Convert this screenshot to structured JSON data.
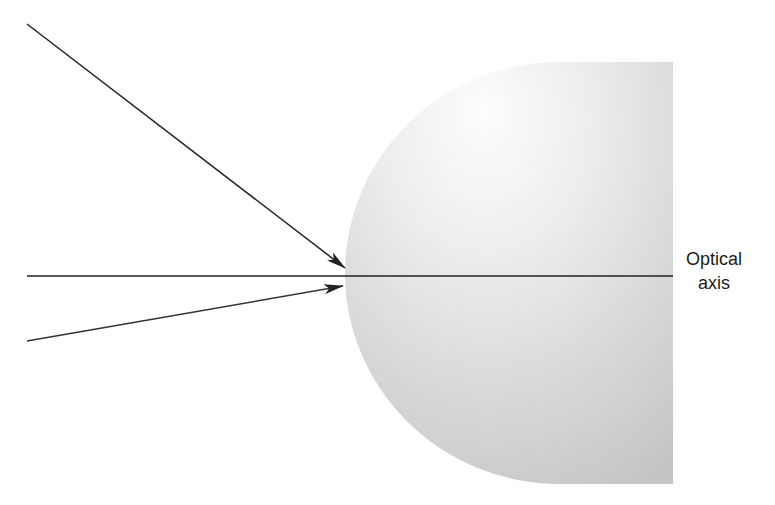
{
  "diagram": {
    "labels": {
      "axis_line1": "Optical",
      "axis_line2": "axis"
    },
    "colors": {
      "background": "#ffffff",
      "ray": "#222222",
      "lens_light": "#fbfbfb",
      "lens_mid": "#e4e4e4",
      "lens_dark": "#c9c9c9"
    },
    "lens": {
      "shape": "plano-convex half-disc",
      "top_y": 62,
      "bottom_y": 484,
      "flat_edge_x": 673,
      "vertex_x": 345,
      "vertex_y": 276
    },
    "optical_axis": {
      "x1": 27,
      "y1": 276,
      "x2": 673,
      "y2": 276
    },
    "rays": [
      {
        "name": "oblique-ray-from-above",
        "x1": 27,
        "y1": 24,
        "x2": 345,
        "y2": 268,
        "arrow": true
      },
      {
        "name": "axial-ray",
        "x1": 27,
        "y1": 277,
        "x2": 345,
        "y2": 277,
        "arrow": false
      },
      {
        "name": "oblique-ray-from-below",
        "x1": 27,
        "y1": 341,
        "x2": 343,
        "y2": 286,
        "arrow": true
      }
    ]
  }
}
